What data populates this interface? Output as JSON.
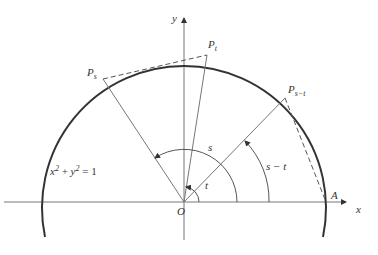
{
  "figure": {
    "equation": {
      "x": "x",
      "sup1": "2",
      "plus": " + ",
      "y": "y",
      "sup2": "2",
      "eq": " = 1"
    },
    "labels": {
      "y_axis": "y",
      "x_axis": "x",
      "origin": "O",
      "point_A": "A",
      "P_s": {
        "base": "P",
        "sub": "s"
      },
      "P_t": {
        "base": "P",
        "sub": "t"
      },
      "P_s_minus_t": {
        "base": "P",
        "sub": "s−t"
      },
      "angle_s": "s",
      "angle_t": "t",
      "angle_s_minus_t": "s − t"
    },
    "colors": {
      "circle": "#333333",
      "axes": "#666666",
      "lines": "#777777"
    }
  }
}
